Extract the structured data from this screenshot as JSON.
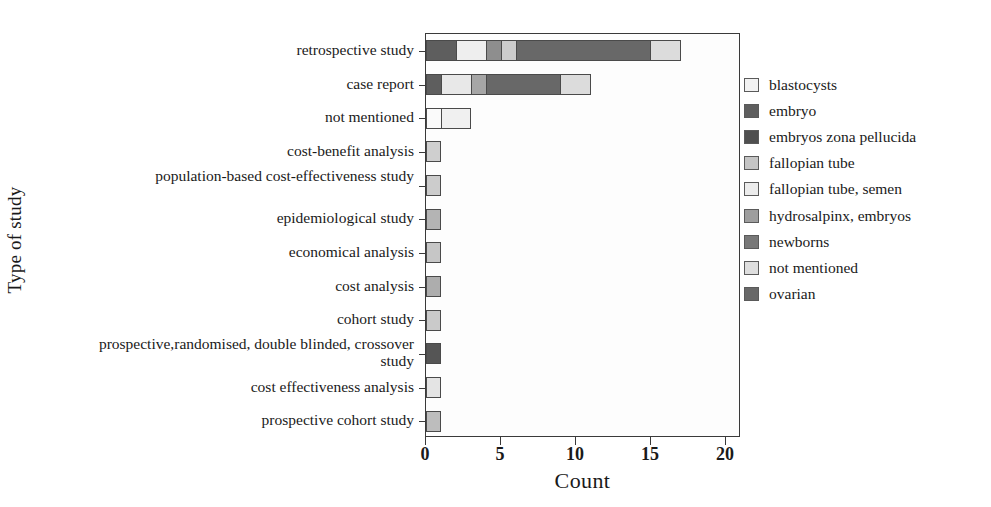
{
  "chart_data": {
    "type": "bar",
    "orientation": "horizontal",
    "stacked": true,
    "title": "",
    "xlabel": "Count",
    "ylabel": "Type of study",
    "xlim": [
      0,
      21
    ],
    "xticks": [
      0,
      5,
      10,
      15,
      20
    ],
    "xtick_labels": [
      "0",
      "5",
      "10",
      "15",
      "20"
    ],
    "grid": false,
    "legend_position": "right",
    "categories": [
      "retrospective study",
      "case report",
      "not mentioned",
      "cost-benefit analysis",
      "population-based cost-effectiveness study",
      "epidemiological study",
      "economical analysis",
      "cost analysis",
      "cohort study",
      "prospective,randomised, double blinded, crossover study",
      "cost effectiveness analysis",
      "prospective cohort study"
    ],
    "series": [
      {
        "name": "blastocysts",
        "color": "#e8e8e8",
        "values": [
          0,
          0,
          0,
          0,
          0,
          0,
          0,
          0,
          0,
          0,
          0,
          0
        ]
      },
      {
        "name": "embryo",
        "color": "#5e5e5e",
        "values": [
          2,
          1,
          0,
          0,
          0,
          0,
          0,
          0,
          0,
          0,
          0,
          0
        ]
      },
      {
        "name": "embryos zona pellucida",
        "color": "#4a4a4a",
        "values": [
          0,
          0,
          0,
          0,
          0,
          0,
          0,
          0,
          0,
          1,
          0,
          0
        ]
      },
      {
        "name": "fallopian tube",
        "color": "#c8c8c8",
        "values": [
          0,
          0,
          0,
          1,
          1,
          0,
          1,
          0,
          1,
          0,
          0,
          1
        ]
      },
      {
        "name": "fallopian tube, semen",
        "color": "#eeeeee",
        "values": [
          2,
          2,
          2,
          0,
          0,
          0,
          0,
          0,
          0,
          0,
          1,
          0
        ]
      },
      {
        "name": "hydrosalpinx, embryos",
        "color": "#9a9a9a",
        "values": [
          1,
          1,
          0,
          0,
          0,
          1,
          0,
          1,
          0,
          0,
          0,
          0
        ]
      },
      {
        "name": "newborns",
        "color": "#7a7a7a",
        "values": [
          1,
          0,
          1,
          0,
          0,
          0,
          0,
          0,
          0,
          0,
          0,
          0
        ]
      },
      {
        "name": "not mentioned",
        "color": "#e0e0e0",
        "values": [
          2,
          2,
          0,
          0,
          0,
          0,
          0,
          0,
          0,
          0,
          0,
          0
        ]
      },
      {
        "name": "ovarian",
        "color": "#686868",
        "values": [
          9,
          5,
          0,
          0,
          0,
          0,
          0,
          0,
          0,
          0,
          0,
          0
        ]
      }
    ],
    "bars": [
      {
        "category": "retrospective study",
        "total": 17,
        "segments": [
          {
            "series": "embryo",
            "start": 0,
            "end": 2,
            "color": "#5e5e5e"
          },
          {
            "series": "fallopian tube, semen",
            "start": 2,
            "end": 4,
            "color": "#eeeeee"
          },
          {
            "series": "hydrosalpinx, embryos",
            "start": 4,
            "end": 5,
            "color": "#8e8e8e"
          },
          {
            "series": "fallopian tube",
            "start": 5,
            "end": 6,
            "color": "#cccccc"
          },
          {
            "series": "ovarian",
            "start": 6,
            "end": 15,
            "color": "#686868"
          },
          {
            "series": "not mentioned",
            "start": 15,
            "end": 17,
            "color": "#dcdcdc"
          }
        ]
      },
      {
        "category": "case report",
        "total": 11,
        "segments": [
          {
            "series": "embryo",
            "start": 0,
            "end": 1,
            "color": "#5e5e5e"
          },
          {
            "series": "fallopian tube, semen",
            "start": 1,
            "end": 3,
            "color": "#e8e8e8"
          },
          {
            "series": "hydrosalpinx, embryos",
            "start": 3,
            "end": 4,
            "color": "#a6a6a6"
          },
          {
            "series": "ovarian",
            "start": 4,
            "end": 9,
            "color": "#686868"
          },
          {
            "series": "not mentioned",
            "start": 9,
            "end": 11,
            "color": "#dcdcdc"
          }
        ]
      },
      {
        "category": "not mentioned",
        "total": 3,
        "segments": [
          {
            "series": "blastocysts",
            "start": 0,
            "end": 1,
            "color": "#fafafa"
          },
          {
            "series": "fallopian tube, semen",
            "start": 1,
            "end": 3,
            "color": "#f0f0f0"
          }
        ]
      },
      {
        "category": "cost-benefit analysis",
        "total": 1,
        "segments": [
          {
            "series": "fallopian tube",
            "start": 0,
            "end": 1,
            "color": "#cfcfcf"
          }
        ]
      },
      {
        "category": "population-based cost-effectiveness study",
        "total": 1,
        "segments": [
          {
            "series": "fallopian tube",
            "start": 0,
            "end": 1,
            "color": "#cccccc"
          }
        ]
      },
      {
        "category": "epidemiological study",
        "total": 1,
        "segments": [
          {
            "series": "hydrosalpinx, embryos",
            "start": 0,
            "end": 1,
            "color": "#b4b4b4"
          }
        ]
      },
      {
        "category": "economical analysis",
        "total": 1,
        "segments": [
          {
            "series": "fallopian tube",
            "start": 0,
            "end": 1,
            "color": "#c6c6c6"
          }
        ]
      },
      {
        "category": "cost analysis",
        "total": 1,
        "segments": [
          {
            "series": "hydrosalpinx, embryos",
            "start": 0,
            "end": 1,
            "color": "#adadad"
          }
        ]
      },
      {
        "category": "cohort study",
        "total": 1,
        "segments": [
          {
            "series": "fallopian tube",
            "start": 0,
            "end": 1,
            "color": "#cacaca"
          }
        ]
      },
      {
        "category": "prospective,randomised, double blinded, crossover study",
        "total": 1,
        "segments": [
          {
            "series": "embryos zona pellucida",
            "start": 0,
            "end": 1,
            "color": "#555555"
          }
        ]
      },
      {
        "category": "cost effectiveness analysis",
        "total": 1,
        "segments": [
          {
            "series": "fallopian tube, semen",
            "start": 0,
            "end": 1,
            "color": "#e4e4e4"
          }
        ]
      },
      {
        "category": "prospective cohort study",
        "total": 1,
        "segments": [
          {
            "series": "fallopian tube",
            "start": 0,
            "end": 1,
            "color": "#bdbdbd"
          }
        ]
      }
    ]
  },
  "axes": {
    "x_title": "Count",
    "y_title": "Type of study"
  },
  "legend": {
    "items": [
      {
        "label": "blastocysts",
        "color": "#f2f2f2"
      },
      {
        "label": "embryo",
        "color": "#5e5e5e"
      },
      {
        "label": "embryos zona pellucida",
        "color": "#4f4f4f"
      },
      {
        "label": "fallopian tube",
        "color": "#c4c4c4"
      },
      {
        "label": "fallopian tube, semen",
        "color": "#ececec"
      },
      {
        "label": "hydrosalpinx, embryos",
        "color": "#9e9e9e"
      },
      {
        "label": "newborns",
        "color": "#787878"
      },
      {
        "label": "not mentioned",
        "color": "#dedede"
      },
      {
        "label": "ovarian",
        "color": "#686868"
      }
    ]
  }
}
